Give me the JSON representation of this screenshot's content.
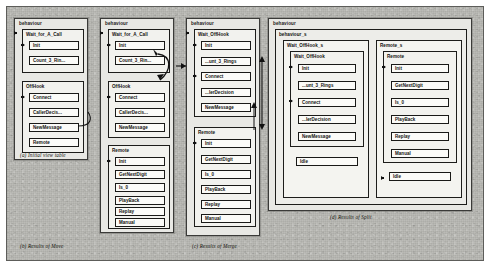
{
  "figure": {
    "background_color": "#b9b9b4",
    "box_fill": "#fbfbf8",
    "line_color": "#191917"
  },
  "panels": [
    {
      "id": "a",
      "root_label": "behaviour",
      "caption": "(a) Initial view table",
      "groups": [
        {
          "label": "Wait_for_A_Call",
          "items": [
            "Init",
            "Count_3_Rin..."
          ]
        },
        {
          "label": "OffHook",
          "items": [
            "Connect",
            "CallerDecis...",
            "NewMessage",
            "Remote"
          ]
        }
      ]
    },
    {
      "id": "b",
      "root_label": "behaviour",
      "caption": "(b) Results of Move",
      "groups": [
        {
          "label": "Wait_for_A_Call",
          "items": [
            "Init",
            "Count_3_Rin..."
          ]
        },
        {
          "label": "OffHook",
          "items": [
            "Connect",
            "CallerDecis...",
            "NewMessage"
          ]
        },
        {
          "label": "Remote",
          "items": [
            "Init",
            "GetNextDigit",
            "Is_0",
            "PlayBack",
            "Replay",
            "Manual"
          ]
        }
      ]
    },
    {
      "id": "c",
      "root_label": "behaviour",
      "caption": "(c) Results of Merge",
      "groups": [
        {
          "label": "Wait_OffHook",
          "items": [
            "Init",
            "...unt_3_Rings",
            "Connect",
            "...lerDecision",
            "NewMessage"
          ]
        },
        {
          "label": "Remote",
          "items": [
            "Init",
            "GetNextDigit",
            "Is_0",
            "PlayBack",
            "Replay",
            "Manual"
          ]
        }
      ]
    },
    {
      "id": "d",
      "root_label": "behaviour",
      "caption": "(d) Results of Split",
      "inner_label": "behaviour_s",
      "columns": [
        {
          "label": "Wait_OffHook_s",
          "group": {
            "label": "Wait_OffHook",
            "items": [
              "Init",
              "...unt_3_Rings",
              "Connect",
              "...lerDecision",
              "NewMessage"
            ]
          },
          "extra_item": "Idle"
        },
        {
          "label": "Remote_s",
          "group": {
            "label": "Remote",
            "items": [
              "Init",
              "GetNextDigit",
              "Is_0",
              "PlayBack",
              "Replay",
              "Manual"
            ]
          },
          "extra_item": "Idle"
        }
      ]
    }
  ],
  "watermark": "PAGE SCAN"
}
